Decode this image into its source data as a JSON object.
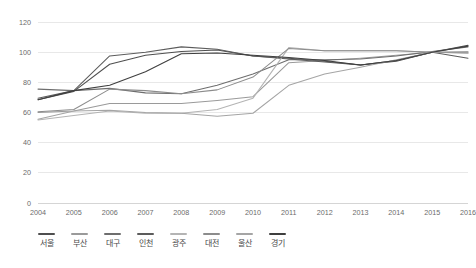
{
  "chart_data": {
    "type": "line",
    "title": "",
    "subtitle": "",
    "xlabel": "",
    "ylabel": "",
    "grid": true,
    "legend_position": "bottom",
    "xlim": [
      2004,
      2016
    ],
    "ylim": [
      0,
      120
    ],
    "x": [
      2004,
      2005,
      2006,
      2007,
      2008,
      2009,
      2010,
      2011,
      2012,
      2013,
      2014,
      2015,
      2016
    ],
    "categories": [
      "2004",
      "2005",
      "2006",
      "2007",
      "2008",
      "2009",
      "2010",
      "2011",
      "2012",
      "2013",
      "2014",
      "2015",
      "2016"
    ],
    "x_tick_labels": [
      "2004",
      "2005",
      "2006",
      "2007",
      "2008",
      "2009",
      "2010",
      "2011",
      "2012",
      "2013",
      "2014",
      "2015",
      "2016"
    ],
    "y_ticks": [
      0,
      20,
      40,
      60,
      80,
      100,
      120
    ],
    "y_tick_labels": [
      "0",
      "20",
      "40",
      "60",
      "80",
      "100",
      "120"
    ],
    "series": [
      {
        "name": "서울",
        "color": "#4f4f4f",
        "values": [
          68.5,
          74.0,
          92.0,
          98.0,
          100.5,
          101.5,
          97.5,
          96.0,
          94.0,
          91.5,
          94.0,
          100.0,
          104.5
        ]
      },
      {
        "name": "부산",
        "color": "#9a9a9a",
        "values": [
          60.0,
          61.0,
          66.0,
          66.0,
          66.0,
          68.0,
          70.5,
          93.0,
          94.5,
          96.0,
          98.0,
          100.0,
          100.0
        ]
      },
      {
        "name": "대구",
        "color": "#6e6e6e",
        "values": [
          75.5,
          74.5,
          76.0,
          73.0,
          72.5,
          78.0,
          85.5,
          95.0,
          95.0,
          95.5,
          97.5,
          100.5,
          103.5
        ]
      },
      {
        "name": "인천",
        "color": "#5c5c5c",
        "values": [
          69.5,
          74.5,
          97.5,
          100.0,
          103.5,
          102.0,
          97.5,
          95.5,
          93.5,
          91.5,
          94.5,
          100.0,
          96.0
        ]
      },
      {
        "name": "광주",
        "color": "#b4b4b4",
        "values": [
          55.0,
          58.0,
          61.0,
          59.5,
          59.5,
          62.0,
          69.5,
          103.0,
          101.0,
          101.0,
          101.0,
          100.0,
          99.5
        ]
      },
      {
        "name": "대전",
        "color": "#8c8c8c",
        "values": [
          60.5,
          62.0,
          75.5,
          74.5,
          72.5,
          75.0,
          83.5,
          102.5,
          101.0,
          101.0,
          101.0,
          100.0,
          99.5
        ]
      },
      {
        "name": "울산",
        "color": "#a5a5a5",
        "values": [
          55.5,
          61.0,
          61.5,
          60.0,
          59.5,
          57.5,
          59.5,
          78.0,
          85.5,
          90.0,
          95.0,
          100.0,
          100.5
        ]
      },
      {
        "name": "경기",
        "color": "#3f3f3f",
        "values": [
          68.5,
          74.5,
          78.0,
          87.0,
          99.0,
          99.5,
          98.0,
          96.5,
          94.5,
          91.5,
          94.5,
          100.0,
          104.0
        ]
      }
    ]
  },
  "legend": {
    "items": [
      {
        "label": "서울",
        "color": "#4f4f4f"
      },
      {
        "label": "부산",
        "color": "#9a9a9a"
      },
      {
        "label": "대구",
        "color": "#6e6e6e"
      },
      {
        "label": "인천",
        "color": "#5c5c5c"
      },
      {
        "label": "광주",
        "color": "#b4b4b4"
      },
      {
        "label": "대전",
        "color": "#8c8c8c"
      },
      {
        "label": "울산",
        "color": "#a5a5a5"
      },
      {
        "label": "경기",
        "color": "#3f3f3f"
      }
    ]
  },
  "colors": {
    "grid": "#e2e2e2",
    "axis_text": "#6b6b6b",
    "legend_text": "#4a4a4a",
    "background": "#ffffff"
  }
}
